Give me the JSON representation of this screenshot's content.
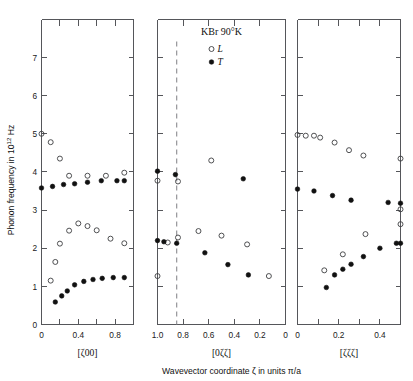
{
  "figure": {
    "title": "KBr 90°K",
    "ylabel_main": "Phonon frequency in 10",
    "ylabel_exp": "12",
    "ylabel_unit": " Hz",
    "xlabel_main": "Wavevector coordinate ζ in units π/a",
    "legend": [
      {
        "symbol": "open-circle",
        "label": "L"
      },
      {
        "symbol": "filled-circle",
        "label": "T"
      }
    ],
    "colors": {
      "axis": "#55565a",
      "text": "#111111",
      "open_marker_stroke": "#3c3d40",
      "filled_marker": "#111111",
      "dashed_guide": "#8a8b8f",
      "background": "#ffffff"
    }
  },
  "chart_data": {
    "type": "scatter",
    "title": "KBr 90°K",
    "ylabel": "Phonon frequency in 10^12 Hz",
    "xlabel": "Wavevector coordinate ζ in units π/a",
    "ylim": [
      0,
      7.85
    ],
    "yticks": [
      0,
      1,
      2,
      3,
      4,
      5,
      6,
      7
    ],
    "yticklabels": [
      "0",
      "1",
      "2",
      "3",
      "4",
      "5",
      "6",
      "7"
    ],
    "grid": false,
    "legend_position": "top-center-panel2",
    "legend_entries": [
      "L",
      "T"
    ],
    "panels": [
      {
        "name": "panel-zeta00",
        "axis_label": "[ζ00]",
        "direction": "[ζ00]",
        "xlim": [
          0,
          1.0
        ],
        "xticks": [
          0,
          0.2,
          0.4,
          0.6,
          0.8,
          1.0
        ],
        "xticklabels": [
          "0",
          "",
          "0.4",
          "",
          "0.8",
          "1.0"
        ],
        "xticklabels_shown": [
          {
            "value": 0,
            "label": "0"
          },
          {
            "value": 0.4,
            "label": "0.4"
          },
          {
            "value": 0.8,
            "label": "0.8"
          }
        ],
        "series": [
          {
            "name": "L",
            "symbol": "open-circle",
            "points": [
              [
                0.0,
                5.0
              ],
              [
                0.1,
                4.78
              ],
              [
                0.2,
                4.35
              ],
              [
                0.3,
                3.9
              ],
              [
                0.5,
                3.9
              ],
              [
                0.7,
                3.9
              ],
              [
                0.9,
                3.98
              ],
              [
                0.1,
                1.15
              ],
              [
                0.15,
                1.64
              ],
              [
                0.2,
                2.12
              ],
              [
                0.3,
                2.46
              ],
              [
                0.4,
                2.65
              ],
              [
                0.5,
                2.58
              ],
              [
                0.6,
                2.47
              ],
              [
                0.75,
                2.25
              ],
              [
                0.9,
                2.13
              ]
            ]
          },
          {
            "name": "T",
            "symbol": "filled-circle",
            "points": [
              [
                0.0,
                3.58
              ],
              [
                0.12,
                3.62
              ],
              [
                0.24,
                3.67
              ],
              [
                0.36,
                3.69
              ],
              [
                0.5,
                3.73
              ],
              [
                0.65,
                3.77
              ],
              [
                0.82,
                3.77
              ],
              [
                0.9,
                3.77
              ],
              [
                0.15,
                0.59
              ],
              [
                0.22,
                0.75
              ],
              [
                0.28,
                0.88
              ],
              [
                0.36,
                1.04
              ],
              [
                0.46,
                1.13
              ],
              [
                0.56,
                1.18
              ],
              [
                0.66,
                1.21
              ],
              [
                0.78,
                1.23
              ],
              [
                0.9,
                1.23
              ]
            ]
          }
        ]
      },
      {
        "name": "panel-0zetazeta",
        "axis_label": "[0ζζ]",
        "direction": "[0ζζ]",
        "xlim": [
          1.0,
          0.0
        ],
        "reversed": true,
        "xticks": [
          1.0,
          0.8,
          0.6,
          0.4,
          0.2,
          0.0
        ],
        "xticklabels_shown": [
          {
            "value": 1.0,
            "label": "1.0"
          },
          {
            "value": 0.8,
            "label": "0.8"
          },
          {
            "value": 0.6,
            "label": "0.6"
          },
          {
            "value": 0.4,
            "label": "0.4"
          },
          {
            "value": 0.2,
            "label": "0.2"
          },
          {
            "value": 0.0,
            "label": "0"
          }
        ],
        "guide_line": {
          "type": "vertical-dashed",
          "value": 0.85
        },
        "series": [
          {
            "name": "L",
            "symbol": "open-circle",
            "points": [
              [
                1.0,
                3.77
              ],
              [
                0.84,
                3.75
              ],
              [
                0.58,
                4.3
              ],
              [
                0.92,
                2.15
              ],
              [
                0.84,
                2.28
              ],
              [
                0.68,
                2.45
              ],
              [
                0.5,
                2.33
              ],
              [
                0.3,
                2.1
              ],
              [
                0.13,
                1.27
              ],
              [
                1.0,
                1.27
              ]
            ]
          },
          {
            "name": "T",
            "symbol": "filled-circle",
            "points": [
              [
                1.0,
                4.02
              ],
              [
                0.86,
                3.93
              ],
              [
                0.33,
                3.82
              ],
              [
                1.0,
                2.2
              ],
              [
                0.95,
                2.17
              ],
              [
                0.85,
                2.13
              ],
              [
                0.63,
                1.88
              ],
              [
                0.45,
                1.57
              ],
              [
                0.29,
                1.3
              ]
            ]
          }
        ]
      },
      {
        "name": "panel-zetazetazeta",
        "axis_label": "[ζζζ]",
        "direction": "[ζζζ]",
        "xlim": [
          0,
          0.5
        ],
        "xticks": [
          0,
          0.1,
          0.2,
          0.3,
          0.4,
          0.5
        ],
        "xticklabels_shown": [
          {
            "value": 0,
            "label": "0"
          },
          {
            "value": 0.2,
            "label": "0.2"
          },
          {
            "value": 0.4,
            "label": "0.4"
          }
        ],
        "series": [
          {
            "name": "L",
            "symbol": "open-circle",
            "points": [
              [
                0.0,
                4.97
              ],
              [
                0.04,
                4.95
              ],
              [
                0.08,
                4.95
              ],
              [
                0.11,
                4.9
              ],
              [
                0.18,
                4.77
              ],
              [
                0.25,
                4.57
              ],
              [
                0.32,
                4.43
              ],
              [
                0.5,
                4.35
              ],
              [
                0.5,
                3.02
              ],
              [
                0.33,
                2.37
              ],
              [
                0.22,
                1.84
              ],
              [
                0.13,
                1.42
              ],
              [
                0.5,
                2.63
              ]
            ]
          },
          {
            "name": "T",
            "symbol": "filled-circle",
            "points": [
              [
                0.0,
                3.55
              ],
              [
                0.08,
                3.5
              ],
              [
                0.17,
                3.38
              ],
              [
                0.26,
                3.26
              ],
              [
                0.44,
                3.2
              ],
              [
                0.5,
                3.18
              ],
              [
                0.14,
                0.97
              ],
              [
                0.18,
                1.3
              ],
              [
                0.22,
                1.45
              ],
              [
                0.26,
                1.58
              ],
              [
                0.32,
                1.78
              ],
              [
                0.4,
                2.0
              ],
              [
                0.5,
                2.13
              ],
              [
                0.48,
                2.13
              ]
            ]
          }
        ]
      }
    ]
  }
}
